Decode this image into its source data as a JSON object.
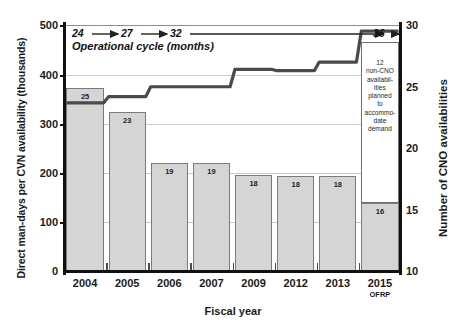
{
  "chart_data": {
    "type": "bar",
    "title": "",
    "xlabel": "Fiscal year",
    "ylabel": "Direct man-days per CVN availability (thousands)",
    "ylabel_right": "Number of CNO availabilities",
    "categories": [
      "2004",
      "2005",
      "2006",
      "2007",
      "2009",
      "2012",
      "2013",
      "2015"
    ],
    "category_sublabels": [
      "",
      "",
      "",
      "",
      "",
      "",
      "",
      "OFRP"
    ],
    "ylim": [
      0,
      500
    ],
    "yticks": [
      0,
      100,
      200,
      300,
      400,
      500
    ],
    "ylim_right": [
      10,
      30
    ],
    "yticks_right": [
      10,
      15,
      20,
      25,
      30
    ],
    "grid": true,
    "legend_position": "none",
    "series": [
      {
        "name": "Direct man-days per CVN availability (thousands)",
        "type": "bar",
        "axis": "left",
        "values": [
          373,
          323,
          220,
          220,
          196,
          195,
          195,
          140
        ],
        "data_labels": [
          "25",
          "23",
          "19",
          "19",
          "18",
          "18",
          "18",
          "16"
        ],
        "data_label_meaning": "Number of CNO availabilities"
      },
      {
        "name": "Number of CNO availabilities",
        "type": "line",
        "axis": "right",
        "values": [
          23.7,
          24.2,
          25.0,
          25.0,
          26.4,
          26.3,
          27.0,
          29.5
        ]
      }
    ],
    "annotations": {
      "operational_cycle": {
        "caption": "Operational cycle (months)",
        "values": [
          "24",
          "27",
          "32",
          "36"
        ],
        "arrows": 4
      },
      "callout": {
        "text": "12 non-CNO availabilities planned to accommodate demand",
        "lines": [
          "12",
          "non-CNO",
          "availabil-",
          "ities",
          "planned",
          "to",
          "accommo-",
          "date",
          "demand"
        ],
        "attached_to_category": "2015"
      }
    },
    "colors": {
      "bar_fill": "#d5d5d5",
      "bar_border": "#7a7a7a",
      "line": "#4a4a4a",
      "axis": "#111111",
      "grid": "#c9c9c9",
      "callout_bg": "#ffffff"
    }
  }
}
